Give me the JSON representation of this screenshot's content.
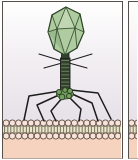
{
  "figure": {
    "description_parts": [
      "bacteriophage",
      "capsid",
      "collar-whiskers",
      "tail-sheath",
      "baseplate",
      "tail-fibers",
      "lipid-bilayer-membrane",
      "cytoplasm"
    ],
    "panels_visible": 2
  },
  "colors": {
    "border": "#55504c",
    "bg_top": "#ffffff",
    "bg_mid": "#f3f0f3",
    "bg_bottom": "#e4dee6",
    "capsid_fill": "#afcba0",
    "capsid_light": "#c1d6b2",
    "capsid_dark": "#9ab98c",
    "capsid_edge": "#2c4527",
    "outline": "#1d1d1d",
    "tail_fill": "#31402c",
    "tail_stripe": "#68815c",
    "baseplate_fill": "#74a061",
    "baseplate_edge": "#1f2e18",
    "fiber": "#1d1d1d",
    "head_fill": "#f6e3dc",
    "head_stroke": "#5d483b",
    "band_fill": "#e9e7cb",
    "band_line": "#6b6353",
    "band_edge": "#4e4337",
    "cytoplasm": "#f6d3bf",
    "gap_bg": "#ffffff",
    "bottom_shadow": "#b4a89f"
  },
  "membrane": {
    "heads_per_row_main": 19,
    "heads_per_row_sliver": 2,
    "rows": 2,
    "spacing": 6.2,
    "head_r": 3.1,
    "row1_cy": 121,
    "row2_cy": 134,
    "band_top": 124,
    "band_bottom": 131,
    "tail_line_offset": 1.6
  },
  "phage": {
    "sheath_stripe_count": 9,
    "sheath_stripe_top": 58.5,
    "sheath_stripe_step": 3.6,
    "tail_fiber_count": 6
  }
}
